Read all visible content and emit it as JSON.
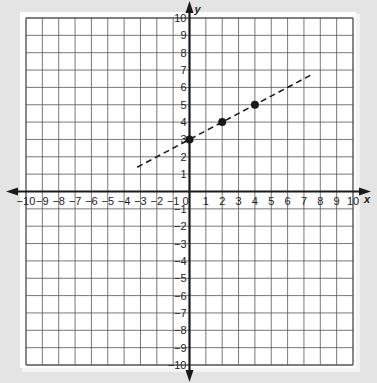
{
  "chart_data": {
    "type": "scatter",
    "title": "",
    "xlabel": "x",
    "ylabel": "y",
    "xlim": [
      -10,
      10
    ],
    "ylim": [
      -10,
      10
    ],
    "grid": true,
    "x_ticks": [
      -10,
      -9,
      -8,
      -7,
      -6,
      -5,
      -4,
      -3,
      -2,
      -1,
      0,
      1,
      2,
      3,
      4,
      5,
      6,
      7,
      8,
      9,
      10
    ],
    "y_ticks": [
      -10,
      -9,
      -8,
      -7,
      -6,
      -5,
      -4,
      -3,
      -2,
      -1,
      1,
      2,
      3,
      4,
      5,
      6,
      7,
      8,
      9,
      10
    ],
    "points": [
      {
        "x": 0,
        "y": 3
      },
      {
        "x": 2,
        "y": 4
      },
      {
        "x": 4,
        "y": 5
      }
    ],
    "line": {
      "style": "dashed",
      "slope": 0.5,
      "intercept": 3,
      "x_start": -3.2,
      "x_end": 7.6
    }
  },
  "colors": {
    "background": "#e4e4e4",
    "paper": "#ffffff",
    "grid": "#555555",
    "axis": "#1a1a1a",
    "line": "#1a1a1a",
    "point": "#1a1a1a"
  }
}
